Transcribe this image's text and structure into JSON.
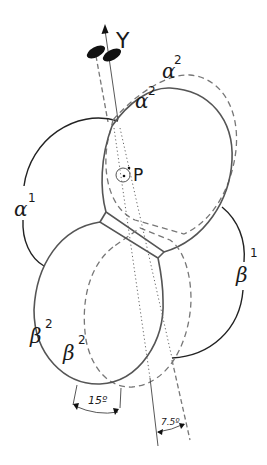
{
  "figure": {
    "type": "rotational molecular symmetry diagram",
    "labels": {
      "axis": "Y",
      "point": "P",
      "alpha1": {
        "base": "α",
        "sup": "1"
      },
      "alpha2_outer": {
        "base": "α",
        "sup": "2"
      },
      "alpha2_inner": {
        "base": "α",
        "sup": "2"
      },
      "beta1": {
        "base": "β",
        "sup": "1"
      },
      "beta2_outer": {
        "base": "β",
        "sup": "2"
      },
      "beta2_inner": {
        "base": "β",
        "sup": "2"
      },
      "angle_large": "15º",
      "angle_small": "7.5º"
    },
    "line_styles": {
      "solid": "original position",
      "dashed": "rotated position",
      "dotted": "axis projection"
    },
    "colors": {
      "solid_stroke": "#555555",
      "arc_stroke": "#222222",
      "dashed_stroke": "#777777",
      "text": "#1a1a1a"
    }
  }
}
